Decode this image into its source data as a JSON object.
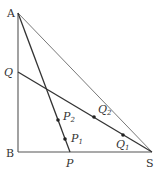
{
  "diagram": {
    "type": "geometry",
    "points": {
      "A": {
        "label": "A",
        "x": 18,
        "y": 13,
        "italic": false
      },
      "B": {
        "label": "B",
        "x": 18,
        "y": 152,
        "italic": false
      },
      "S": {
        "label": "S",
        "x": 152,
        "y": 152,
        "italic": false
      },
      "P": {
        "label": "P",
        "x": 70,
        "y": 152,
        "italic": true
      },
      "Q": {
        "label": "Q",
        "x": 18,
        "y": 72,
        "italic": true
      },
      "P1": {
        "label": "P",
        "sub": "1",
        "x": 66,
        "y": 137,
        "italic": true
      },
      "P2": {
        "label": "P",
        "sub": "2",
        "x": 61,
        "y": 118,
        "italic": true
      },
      "Q1": {
        "label": "Q",
        "sub": "1",
        "x": 123,
        "y": 133,
        "italic": true
      },
      "Q2": {
        "label": "Q",
        "sub": "2",
        "x": 94,
        "y": 114,
        "italic": true
      }
    },
    "segments": [
      "AB",
      "BS",
      "AS",
      "AP",
      "QS"
    ],
    "marked_points": [
      "P1",
      "P2",
      "Q1",
      "Q2"
    ],
    "line_color": "#555555",
    "point_color": "#222222"
  }
}
